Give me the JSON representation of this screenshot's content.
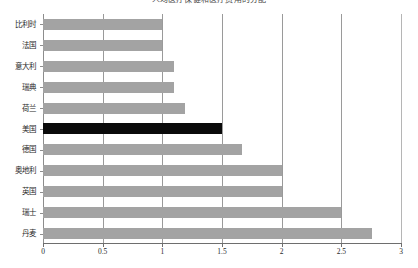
{
  "chart_data": {
    "type": "bar",
    "orientation": "horizontal",
    "title": "人均医疗保健和医疗费用的分配",
    "xlabel": "",
    "ylabel": "",
    "categories": [
      "比利时",
      "法国",
      "意大利",
      "瑞典",
      "荷兰",
      "美国",
      "德国",
      "奥地利",
      "英国",
      "瑞士",
      "丹麦"
    ],
    "values": [
      1.0,
      1.0,
      1.1,
      1.1,
      1.19,
      1.5,
      1.67,
      2.0,
      2.0,
      2.5,
      2.76
    ],
    "xlim": [
      0,
      3
    ],
    "xticks": [
      "0",
      "0.5",
      "1",
      "1.5",
      "2",
      "2.5",
      "3"
    ],
    "xtick_values": [
      0,
      0.5,
      1,
      1.5,
      2,
      2.5,
      3
    ],
    "grid": "vertical",
    "legend": "none",
    "bar_color": "#a3a3a3",
    "highlight_color": "#0a0a0a",
    "highlight_category": "美国",
    "axis_color": "#6e6e6e",
    "gridline_color": "#9a9a9a",
    "background": "#ffffff"
  }
}
